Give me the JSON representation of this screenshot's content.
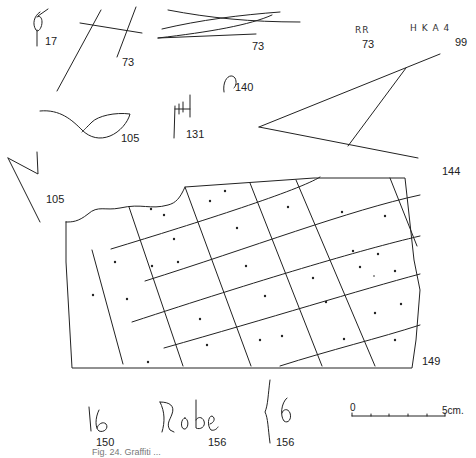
{
  "figure": {
    "caption": "Fig. 24.  Graffiti ...",
    "ink_color": "#222222",
    "background": "#ffffff"
  },
  "items": [
    {
      "id": "17",
      "label": "17",
      "desc": "loop sign"
    },
    {
      "id": "73a",
      "label": "73",
      "desc": "crossed lines (H-shape)"
    },
    {
      "id": "73b",
      "label": "73",
      "desc": "converging lines"
    },
    {
      "id": "73c",
      "label": "73",
      "desc": "letters",
      "text": "RR"
    },
    {
      "id": "99",
      "label": "99",
      "desc": "letters",
      "text": "H K A 4"
    },
    {
      "id": "140",
      "label": "140",
      "desc": "hook sign"
    },
    {
      "id": "105a",
      "label": "105",
      "desc": "leaf / eye shape"
    },
    {
      "id": "131",
      "label": "131",
      "desc": "H with ticks"
    },
    {
      "id": "144",
      "label": "144",
      "desc": "large triangle"
    },
    {
      "id": "105b",
      "label": "105",
      "desc": "N / zigzag"
    },
    {
      "id": "149",
      "label": "149",
      "desc": "gridded slab with dots"
    },
    {
      "id": "150",
      "label": "150",
      "desc": "script",
      "text": "16"
    },
    {
      "id": "156a",
      "label": "156",
      "desc": "script",
      "text": "Robe"
    },
    {
      "id": "156b",
      "label": "156",
      "desc": "script",
      "text": "}6"
    }
  ],
  "scale_bar": {
    "start_label": "0",
    "end_label": "5cm.",
    "ticks": 5
  }
}
